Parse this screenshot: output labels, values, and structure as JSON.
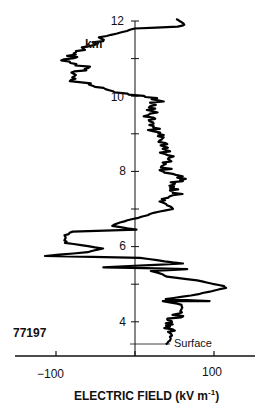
{
  "chart_data": {
    "type": "line",
    "title": "",
    "sounding_id": "77197",
    "xlabel": "ELECTRIC FIELD (kV m",
    "xlabel_superscript": "-1",
    "xlabel_close": ")",
    "ylabel": "km",
    "xlim": [
      -150,
      150
    ],
    "ylim": [
      3.0,
      12.0
    ],
    "x_ticks": [
      -100,
      0,
      100
    ],
    "x_tick_labels": [
      "−100",
      "100"
    ],
    "y_ticks": [
      4,
      5,
      6,
      7,
      8,
      9,
      10,
      11,
      12
    ],
    "y_tick_labels": [
      "4",
      "6",
      "8",
      "10",
      "12"
    ],
    "grid": false,
    "legend": "none",
    "annotations": [
      {
        "text": "Surface",
        "altitude_km": 3.4
      },
      {
        "text": "77197"
      }
    ],
    "series": [
      {
        "name": "Electric field profile",
        "points": [
          [
            39,
            3.4
          ],
          [
            45,
            3.5
          ],
          [
            46,
            3.7
          ],
          [
            44,
            3.9
          ],
          [
            47,
            4.05
          ],
          [
            58,
            4.25
          ],
          [
            60,
            4.45
          ],
          [
            36,
            4.55
          ],
          [
            95,
            4.55
          ],
          [
            38,
            4.6
          ],
          [
            72,
            4.7
          ],
          [
            115,
            4.9
          ],
          [
            112,
            4.95
          ],
          [
            80,
            5.1
          ],
          [
            40,
            5.2
          ],
          [
            30,
            5.3
          ],
          [
            20,
            5.35
          ],
          [
            65,
            5.4
          ],
          [
            -40,
            5.45
          ],
          [
            60,
            5.55
          ],
          [
            5,
            5.7
          ],
          [
            -115,
            5.75
          ],
          [
            -60,
            5.85
          ],
          [
            -40,
            5.95
          ],
          [
            -88,
            6.1
          ],
          [
            -88,
            6.3
          ],
          [
            -80,
            6.4
          ],
          [
            2,
            6.45
          ],
          [
            -30,
            6.55
          ],
          [
            -10,
            6.7
          ],
          [
            10,
            6.8
          ],
          [
            25,
            6.9
          ],
          [
            48,
            7.0
          ],
          [
            35,
            7.2
          ],
          [
            55,
            7.4
          ],
          [
            50,
            7.65
          ],
          [
            60,
            7.8
          ],
          [
            38,
            8.0
          ],
          [
            45,
            8.3
          ],
          [
            35,
            8.6
          ],
          [
            27,
            9.0
          ],
          [
            18,
            9.3
          ],
          [
            20,
            9.6
          ],
          [
            27,
            9.8
          ],
          [
            30,
            9.95
          ],
          [
            -25,
            10.1
          ],
          [
            -45,
            10.25
          ],
          [
            -75,
            10.4
          ],
          [
            -75,
            10.6
          ],
          [
            -60,
            10.75
          ],
          [
            -85,
            10.95
          ],
          [
            -70,
            11.2
          ],
          [
            -55,
            11.4
          ],
          [
            -35,
            11.6
          ],
          [
            0,
            11.8
          ],
          [
            55,
            11.85
          ],
          [
            62,
            11.9
          ],
          [
            57,
            12.0
          ],
          [
            52,
            12.05
          ]
        ]
      }
    ]
  },
  "labels": {
    "y_12": "12",
    "y_10": "10",
    "y_8": "8",
    "y_6": "6",
    "y_4": "4",
    "unit_km": "km",
    "sounding_id": "77197",
    "surface": "Surface",
    "x_neg100": "−100",
    "x_100": "100",
    "xlabel_main": "ELECTRIC FIELD (kV m",
    "xlabel_sup": "-1",
    "xlabel_end": ")"
  }
}
